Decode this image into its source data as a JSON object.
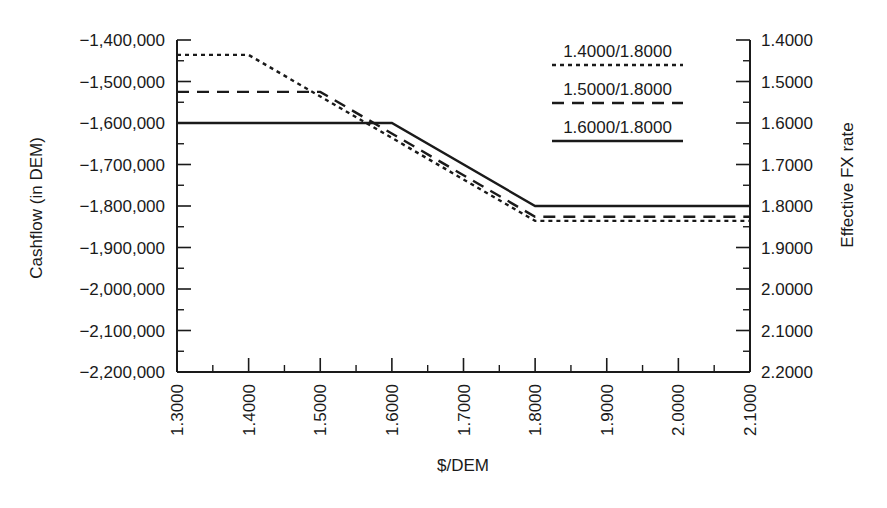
{
  "chart_data": {
    "type": "line",
    "title": "",
    "xlabel": "$/DEM",
    "ylabel": "Cashflow (in DEM)",
    "y2label": "Effective FX rate",
    "xlim": [
      1.3,
      2.1
    ],
    "ylim": [
      -2200000,
      -1400000
    ],
    "y2lim": [
      2.2,
      1.4
    ],
    "grid": false,
    "legend_position": "upper right, inside plot",
    "x_ticks": [
      "1.3000",
      "1.4000",
      "1.5000",
      "1.6000",
      "1.7000",
      "1.8000",
      "1.9000",
      "2.0000",
      "2.1000"
    ],
    "y_ticks": [
      "-1,400,000",
      "-1,500,000",
      "-1,600,000",
      "-1,700,000",
      "-1,800,000",
      "-1,900,000",
      "-2,000,000",
      "-2,100,000",
      "-2,200,000"
    ],
    "y2_ticks": [
      "1.4000",
      "1.5000",
      "1.6000",
      "1.7000",
      "1.8000",
      "1.9000",
      "2.0000",
      "2.1000",
      "2.2000"
    ],
    "series": [
      {
        "name": "1.4000/1.8000",
        "style": "dotted",
        "points": [
          [
            1.3,
            -1436000
          ],
          [
            1.4,
            -1436000
          ],
          [
            1.8,
            -1836000
          ],
          [
            2.1,
            -1836000
          ]
        ]
      },
      {
        "name": "1.5000/1.8000",
        "style": "dashed",
        "points": [
          [
            1.3,
            -1525000
          ],
          [
            1.5,
            -1525000
          ],
          [
            1.8,
            -1826000
          ],
          [
            2.1,
            -1826000
          ]
        ]
      },
      {
        "name": "1.6000/1.8000",
        "style": "solid",
        "points": [
          [
            1.3,
            -1600000
          ],
          [
            1.6,
            -1600000
          ],
          [
            1.8,
            -1800000
          ],
          [
            2.1,
            -1800000
          ]
        ]
      }
    ]
  },
  "legend": {
    "items": [
      {
        "label": "1.4000/1.8000",
        "style": "dotted"
      },
      {
        "label": "1.5000/1.8000",
        "style": "dashed"
      },
      {
        "label": "1.6000/1.8000",
        "style": "solid"
      }
    ]
  },
  "colors": {
    "ink": "#1a1a1a",
    "background": "#ffffff"
  }
}
